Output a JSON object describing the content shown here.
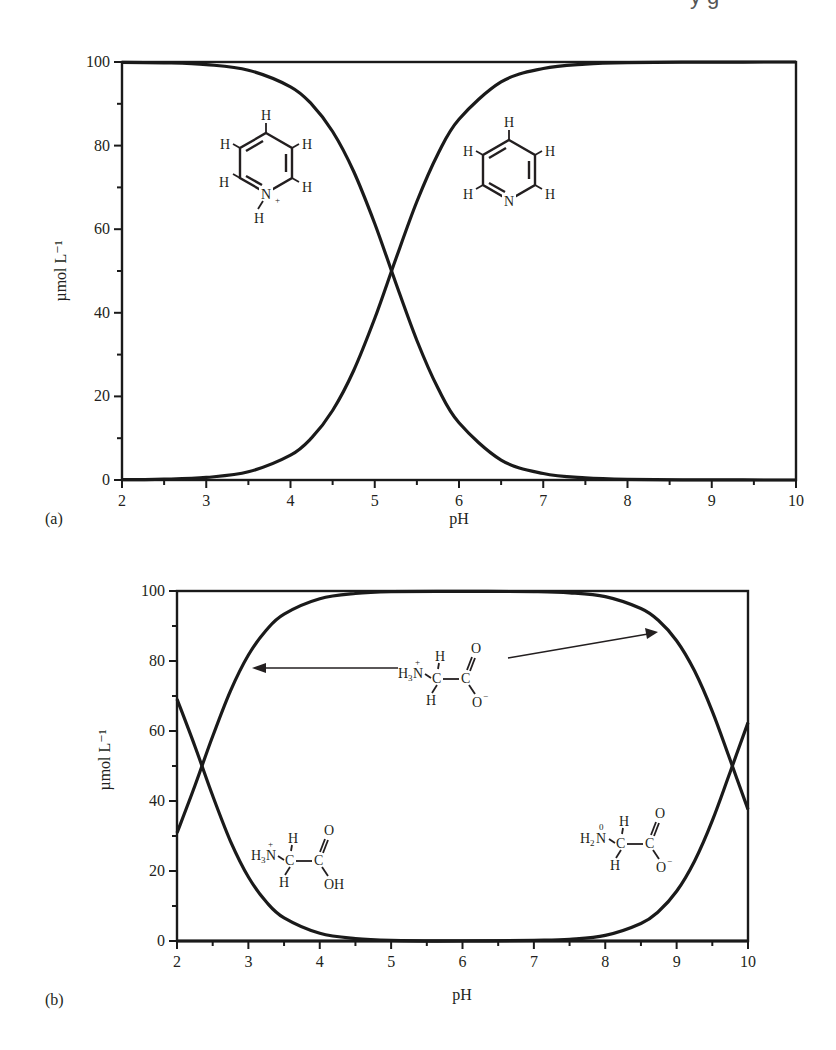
{
  "header_fragment": "y g",
  "chart_data": [
    {
      "panel": "(a)",
      "type": "line",
      "title": "",
      "xlabel": "pH",
      "ylabel": "µmol L⁻¹",
      "xlim": [
        2,
        10
      ],
      "ylim": [
        0,
        100
      ],
      "xticks": [
        2,
        3,
        4,
        5,
        6,
        7,
        8,
        9,
        10
      ],
      "yticks": [
        0,
        20,
        40,
        60,
        80,
        100
      ],
      "grid": false,
      "legend": "none",
      "annotations": [
        "pyridinium ion structure (upper-left)",
        "pyridine structure (upper-right)"
      ],
      "x": [
        2,
        2.5,
        3,
        3.5,
        4,
        4.25,
        4.5,
        4.75,
        5,
        5.25,
        5.5,
        5.75,
        6,
        6.5,
        7,
        7.5,
        8,
        9,
        10
      ],
      "series": [
        {
          "name": "pyridinium (C5H5NH+)",
          "values": [
            99.94,
            99.8,
            99.37,
            98.04,
            94.06,
            89.92,
            83.37,
            73.81,
            61.31,
            47.12,
            33.38,
            21.99,
            13.68,
            4.77,
            1.56,
            0.5,
            0.16,
            0.02,
            0.0
          ]
        },
        {
          "name": "pyridine (C5H5N)",
          "values": [
            0.06,
            0.2,
            0.63,
            1.96,
            5.94,
            10.08,
            16.63,
            26.19,
            38.69,
            52.88,
            66.62,
            78.01,
            86.32,
            95.23,
            98.44,
            99.5,
            99.84,
            99.98,
            100.0
          ]
        }
      ]
    },
    {
      "panel": "(b)",
      "type": "line",
      "title": "",
      "xlabel": "pH",
      "ylabel": "µmol L⁻¹",
      "xlim": [
        2,
        10
      ],
      "ylim": [
        0,
        100
      ],
      "xticks": [
        2,
        3,
        4,
        5,
        6,
        7,
        8,
        9,
        10
      ],
      "yticks": [
        0,
        20,
        40,
        60,
        80,
        100
      ],
      "grid": false,
      "legend": "none",
      "annotations": [
        "glycine zwitterion structure with arrows pointing to the plateau curve",
        "cationic glycine structure (lower-left)",
        "anionic glycine structure (lower-right)"
      ],
      "x": [
        2,
        2.25,
        2.5,
        2.75,
        3,
        3.25,
        3.5,
        4,
        4.5,
        5,
        6,
        7,
        7.5,
        8,
        8.5,
        8.75,
        9,
        9.25,
        9.5,
        9.75,
        10
      ],
      "series": [
        {
          "name": "glycine cation (H3N+CH2COOH)",
          "values": [
            69.1,
            55.7,
            41.5,
            28.5,
            18.3,
            11.2,
            6.6,
            2.2,
            0.7,
            0.2,
            0.02,
            0,
            0,
            0,
            0,
            0,
            0,
            0,
            0,
            0,
            0
          ]
        },
        {
          "name": "glycine zwitterion (H3N+CH2COO-)",
          "values": [
            30.9,
            44.3,
            58.5,
            71.5,
            81.7,
            88.8,
            93.4,
            97.8,
            99.3,
            99.8,
            99.9,
            99.8,
            99.5,
            98.4,
            95.0,
            91.5,
            85.8,
            77.2,
            65.6,
            51.7,
            37.6
          ]
        },
        {
          "name": "glycine anion (H2NCH2COO-)",
          "values": [
            0,
            0,
            0,
            0,
            0,
            0,
            0,
            0,
            0,
            0,
            0,
            0.2,
            0.5,
            1.6,
            5.0,
            8.5,
            14.2,
            22.8,
            34.4,
            48.3,
            62.4
          ]
        }
      ]
    }
  ],
  "chem_labels": {
    "H": "H",
    "N": "N",
    "N_plus": "N",
    "plus": "+",
    "minus": "−",
    "zero": "0",
    "C": "C",
    "O": "O",
    "O_minus": "O",
    "OH": "OH",
    "H3": "H",
    "sub3": "3",
    "H2": "H",
    "sub2": "2"
  }
}
